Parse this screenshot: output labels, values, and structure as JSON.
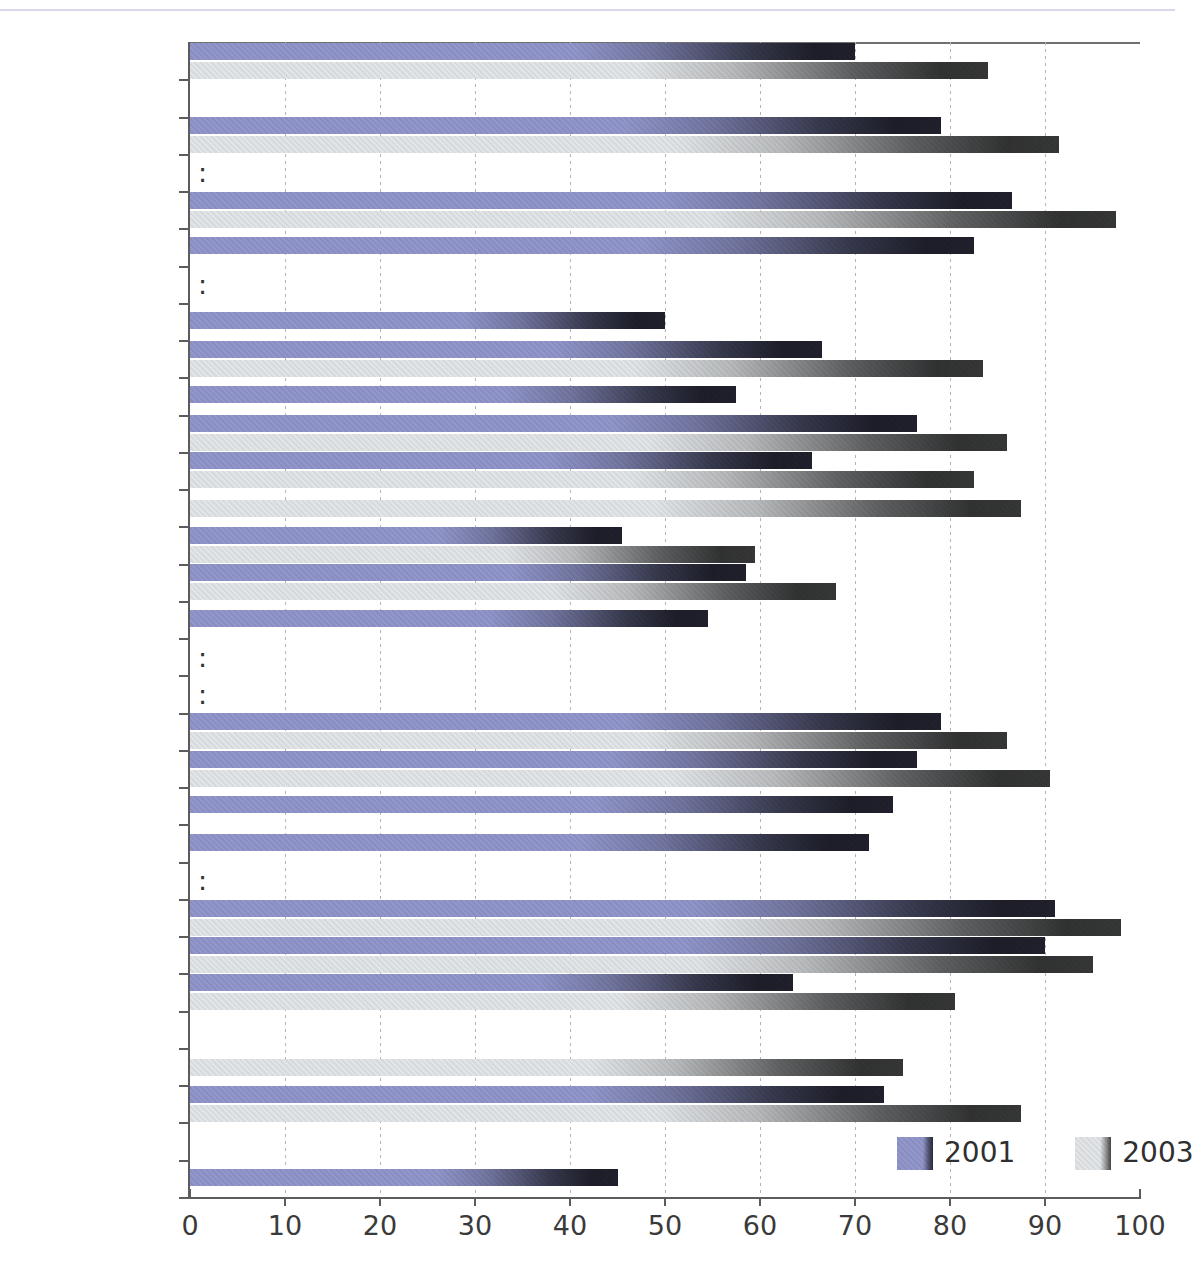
{
  "chart_data": {
    "type": "bar",
    "orientation": "horizontal",
    "title": "",
    "xlabel": "",
    "ylabel": "",
    "xlim": [
      0,
      100
    ],
    "xticks": [
      0,
      10,
      20,
      30,
      40,
      50,
      60,
      70,
      80,
      90,
      100
    ],
    "grid": true,
    "legend_position": "bottom-right",
    "missing_marker": ":",
    "colors": {
      "2001": "#8b8fc4",
      "2003": "#dde0e2",
      "grid": "#b4b4b4",
      "axis": "#5c5c5c",
      "text": "#2f2f2f"
    },
    "series": [
      {
        "name": "2001",
        "values": [
          70,
          null,
          79,
          null,
          86.5,
          82.5,
          null,
          50,
          66.5,
          57.5,
          76.5,
          65.5,
          null,
          45.5,
          58.5,
          54.5,
          null,
          null,
          79,
          76.5,
          74,
          71.5,
          null,
          91,
          90,
          63.5,
          null,
          null,
          73,
          null,
          45
        ]
      },
      {
        "name": "2003",
        "values": [
          84,
          null,
          91.5,
          null,
          97.5,
          null,
          null,
          null,
          83.5,
          null,
          86,
          82.5,
          87.5,
          59.5,
          68,
          null,
          null,
          null,
          86,
          90.5,
          null,
          null,
          null,
          98,
          95,
          80.5,
          null,
          75,
          87.5,
          null,
          null
        ]
      }
    ],
    "categories": [
      {
        "label": "EU-15",
        "spacer": false,
        "missing": false
      },
      {
        "label": "",
        "spacer": true,
        "missing": false
      },
      {
        "label": "Belgium",
        "spacer": false,
        "missing": false
      },
      {
        "label": "Czech Republic",
        "spacer": false,
        "missing": true
      },
      {
        "label": "Denmark",
        "spacer": false,
        "missing": false
      },
      {
        "label": "Germany",
        "spacer": false,
        "missing": false
      },
      {
        "label": "Estonia",
        "spacer": false,
        "missing": true
      },
      {
        "label": "Greece",
        "spacer": false,
        "missing": false
      },
      {
        "label": "Spain",
        "spacer": false,
        "missing": false
      },
      {
        "label": "France",
        "spacer": false,
        "missing": false
      },
      {
        "label": "Ireland",
        "spacer": false,
        "missing": false
      },
      {
        "label": "Italy",
        "spacer": false,
        "missing": false
      },
      {
        "label": "Cyprus",
        "spacer": false,
        "missing": false
      },
      {
        "label": "Latvia",
        "spacer": false,
        "missing": false
      },
      {
        "label": "Lithuania",
        "spacer": false,
        "missing": false
      },
      {
        "label": "Luxembourg",
        "spacer": false,
        "missing": false
      },
      {
        "label": "Hungary",
        "spacer": false,
        "missing": true
      },
      {
        "label": "Malta",
        "spacer": false,
        "missing": true
      },
      {
        "label": "Netherlands",
        "spacer": false,
        "missing": false
      },
      {
        "label": "Austria",
        "spacer": false,
        "missing": false
      },
      {
        "label": "Poland",
        "spacer": false,
        "missing": false
      },
      {
        "label": "Portugal",
        "spacer": false,
        "missing": false
      },
      {
        "label": "Slovenia",
        "spacer": false,
        "missing": true
      },
      {
        "label": "Finland",
        "spacer": false,
        "missing": false
      },
      {
        "label": "Sweden",
        "spacer": false,
        "missing": false
      },
      {
        "label": "United Kingdom",
        "spacer": false,
        "missing": false
      },
      {
        "label": "",
        "spacer": true,
        "missing": false
      },
      {
        "label": "Iceland",
        "spacer": false,
        "missing": false
      },
      {
        "label": "Norway",
        "spacer": false,
        "missing": false
      },
      {
        "label": "",
        "spacer": true,
        "missing": false
      },
      {
        "label": "United States",
        "spacer": false,
        "missing": false
      }
    ]
  },
  "legend": {
    "entries": [
      {
        "label": "2001"
      },
      {
        "label": "2003"
      }
    ]
  },
  "axis": {
    "tick_labels": [
      "0",
      "10",
      "20",
      "30",
      "40",
      "50",
      "60",
      "70",
      "80",
      "90",
      "100"
    ]
  }
}
